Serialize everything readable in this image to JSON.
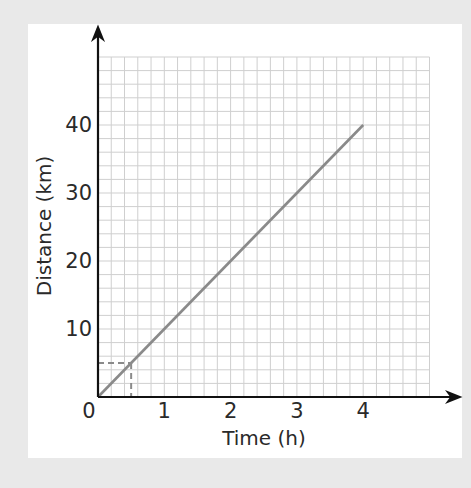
{
  "chart_data": {
    "type": "line",
    "title": "",
    "xlabel": "Time (h)",
    "ylabel": "Distance (km)",
    "xlim": [
      0,
      5
    ],
    "ylim": [
      0,
      50
    ],
    "x_ticks": [
      0,
      1,
      2,
      3,
      4
    ],
    "y_ticks": [
      10,
      20,
      30,
      40
    ],
    "origin_label": "0",
    "grid": true,
    "grid_minor_x_step": 0.2,
    "grid_minor_y_step": 2,
    "series": [
      {
        "name": "distance",
        "x": [
          0,
          4
        ],
        "y": [
          0,
          40
        ],
        "color": "#8a8a8a"
      }
    ],
    "annotations": [
      {
        "type": "dashed-guide",
        "x": 0.5,
        "y": 5,
        "description": "Dashed lines from axes to point (0.5 h, 5 km) on the line",
        "color": "#8a8a8a"
      }
    ],
    "legend": null
  },
  "labels": {
    "xlabel": "Time (h)",
    "ylabel": "Distance (km)",
    "origin": "0",
    "x_ticks": [
      "1",
      "2",
      "3",
      "4"
    ],
    "y_ticks": [
      "10",
      "20",
      "30",
      "40"
    ]
  },
  "colors": {
    "background": "#e9e9e9",
    "card": "#ffffff",
    "grid": "#cfcfcf",
    "axis": "#111111",
    "line": "#8a8a8a"
  }
}
